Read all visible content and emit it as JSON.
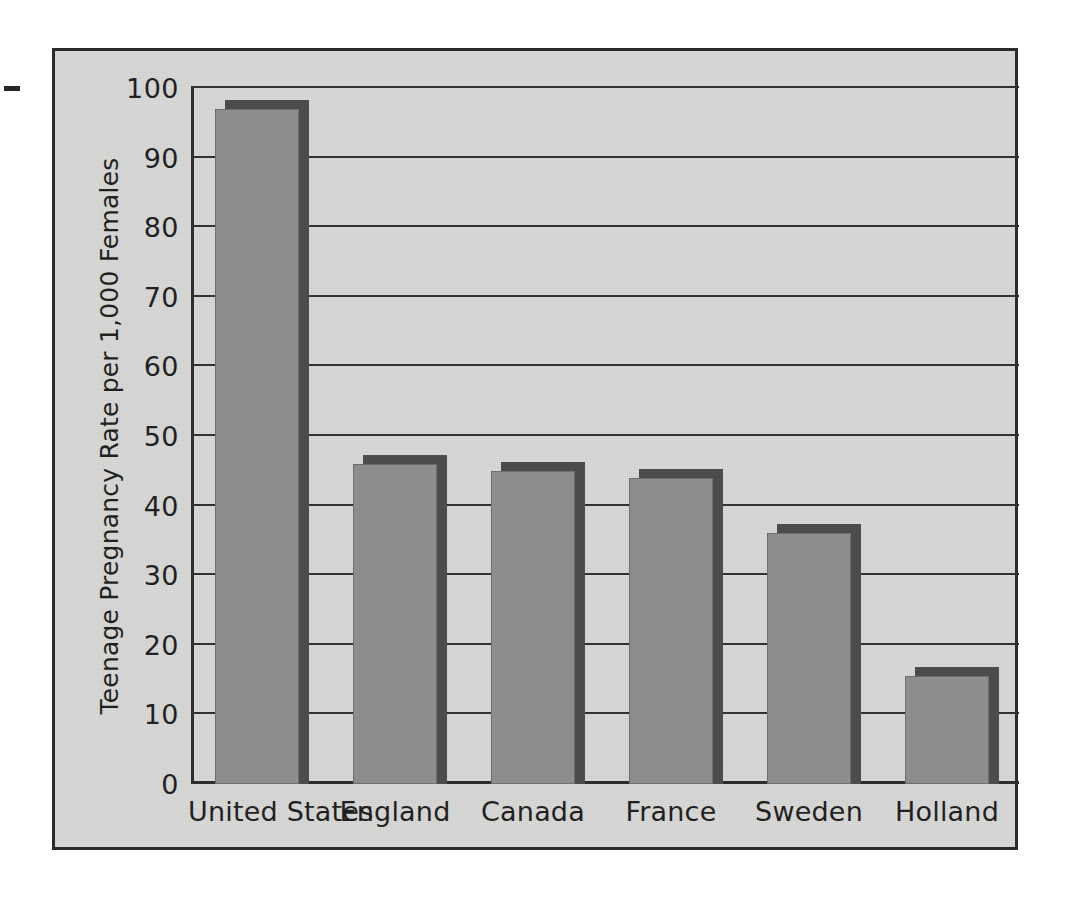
{
  "figure": {
    "background_color": "#d8d8d6",
    "frame_color": "#2b2b2b",
    "left_margin_dash": "dash-mark"
  },
  "chart_data": {
    "type": "bar",
    "title": "",
    "xlabel": "",
    "ylabel": "Teenage Pregnancy Rate per 1,000 Females",
    "categories": [
      "United States",
      "England",
      "Canada",
      "France",
      "Sweden",
      "Holland"
    ],
    "values": [
      97,
      46,
      45,
      44,
      36,
      15.5
    ],
    "ylim": [
      0,
      100
    ],
    "yticks": [
      0,
      10,
      20,
      30,
      40,
      50,
      60,
      70,
      80,
      90,
      100
    ],
    "ytick_labels": [
      "0",
      "10",
      "20",
      "30",
      "40",
      "50",
      "60",
      "70",
      "80",
      "90",
      "100"
    ],
    "grid": true,
    "grid_axis": "y",
    "legend": false,
    "bar_face_color": "#8e8e8e",
    "bar_shadow_color": "#4a4a4a",
    "axis_color": "#2b2b2b"
  }
}
